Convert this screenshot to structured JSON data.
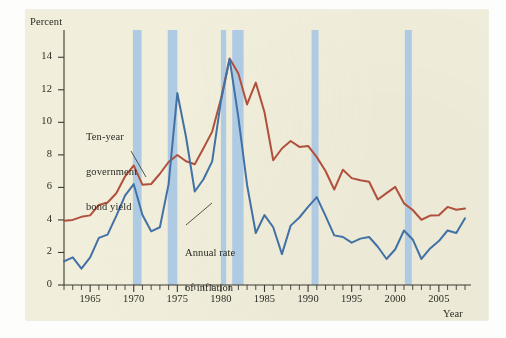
{
  "figure": {
    "background_color": "#f1eedb",
    "page_color": "#fdfdfb"
  },
  "axes": {
    "y_axis_title": "Percent",
    "x_axis_title": "Year",
    "y_ticks": [
      "0",
      "2",
      "4",
      "6",
      "8",
      "10",
      "12",
      "14"
    ],
    "x_ticks": [
      "1965",
      "1970",
      "1975",
      "1980",
      "1985",
      "1990",
      "1995",
      "2000",
      "2005"
    ]
  },
  "annotations": [
    {
      "id": "yield-label",
      "line1": "Ten-year",
      "line2": "government",
      "line3": "bond yield"
    },
    {
      "id": "inflation-label",
      "line1": "Annual rate",
      "line2": "of inflation"
    }
  ],
  "colors": {
    "yield_line": "#b1503c",
    "inflation_line": "#4171a5",
    "recession_band": "#a8c8e4",
    "axis": "#3c3a33",
    "text": "#2c2a24"
  },
  "chart_data": {
    "type": "line",
    "title": "",
    "xlabel": "Year",
    "ylabel": "Percent",
    "xlim": [
      1962,
      2008
    ],
    "ylim": [
      0,
      15
    ],
    "yticks": [
      0,
      2,
      4,
      6,
      8,
      10,
      12,
      14
    ],
    "xticks": [
      1965,
      1970,
      1975,
      1980,
      1985,
      1990,
      1995,
      2000,
      2005
    ],
    "grid": false,
    "legend": "inline-annotations",
    "x": [
      1962,
      1963,
      1964,
      1965,
      1966,
      1967,
      1968,
      1969,
      1970,
      1971,
      1972,
      1973,
      1974,
      1975,
      1976,
      1977,
      1978,
      1979,
      1980,
      1981,
      1982,
      1983,
      1984,
      1985,
      1986,
      1987,
      1988,
      1989,
      1990,
      1991,
      1992,
      1993,
      1994,
      1995,
      1996,
      1997,
      1998,
      1999,
      2000,
      2001,
      2002,
      2003,
      2004,
      2005,
      2006,
      2007,
      2008
    ],
    "series": [
      {
        "name": "Ten-year government bond yield",
        "color": "#b1503c",
        "values": [
          3.95,
          4.0,
          4.19,
          4.28,
          4.92,
          5.07,
          5.64,
          6.67,
          7.35,
          6.16,
          6.21,
          6.84,
          7.56,
          7.99,
          7.61,
          7.42,
          8.41,
          9.43,
          11.43,
          13.92,
          13.0,
          11.1,
          12.44,
          10.62,
          7.67,
          8.39,
          8.85,
          8.49,
          8.55,
          7.86,
          7.01,
          5.87,
          7.09,
          6.57,
          6.44,
          6.35,
          5.26,
          5.65,
          6.03,
          5.02,
          4.61,
          4.01,
          4.27,
          4.29,
          4.8,
          4.63,
          4.7
        ]
      },
      {
        "name": "Annual rate of inflation",
        "color": "#4171a5",
        "values": [
          1.45,
          1.7,
          1.0,
          1.7,
          2.9,
          3.1,
          4.25,
          5.5,
          6.2,
          4.3,
          3.3,
          3.55,
          6.2,
          11.8,
          9.1,
          5.75,
          6.5,
          7.6,
          11.3,
          13.9,
          10.3,
          6.15,
          3.2,
          4.3,
          3.55,
          1.9,
          3.65,
          4.15,
          4.8,
          5.4,
          4.25,
          3.05,
          2.95,
          2.6,
          2.85,
          2.95,
          2.35,
          1.6,
          2.2,
          3.35,
          2.8,
          1.6,
          2.25,
          2.7,
          3.35,
          3.2,
          4.1
        ]
      }
    ],
    "recession_bands": [
      {
        "start": 1969.9,
        "end": 1970.9
      },
      {
        "start": 1973.9,
        "end": 1975.0
      },
      {
        "start": 1980.0,
        "end": 1980.6
      },
      {
        "start": 1981.3,
        "end": 1982.6
      },
      {
        "start": 1990.4,
        "end": 1991.2
      },
      {
        "start": 2001.1,
        "end": 2001.9
      }
    ]
  }
}
